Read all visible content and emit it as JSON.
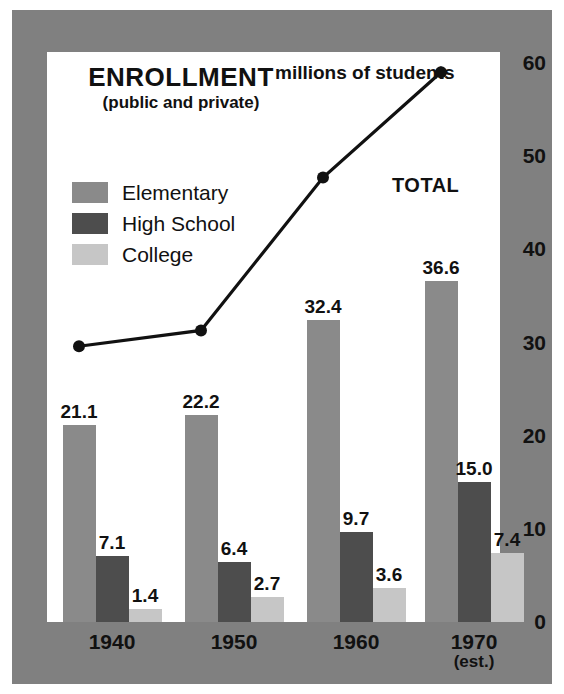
{
  "chart_data": {
    "type": "bar",
    "title": "ENROLLMENT",
    "subtitle": "(public and private)",
    "units_note": "millions of students",
    "total_annotation": "TOTAL",
    "xlabel": "",
    "ylabel": "",
    "ylim": [
      0,
      60
    ],
    "yticks": [
      0,
      10,
      20,
      30,
      40,
      50,
      60
    ],
    "ytick_labels": [
      "0",
      "10",
      "20",
      "30",
      "40",
      "50",
      "60"
    ],
    "grid": false,
    "legend_position": "upper-left",
    "categories": [
      "1940",
      "1950",
      "1960",
      "1970"
    ],
    "category_sublabels": [
      "",
      "",
      "",
      "(est.)"
    ],
    "series": [
      {
        "name": "Elementary",
        "color": "#8a8a8a",
        "values": [
          21.1,
          22.2,
          32.4,
          36.6
        ],
        "labels": [
          "21.1",
          "22.2",
          "32.4",
          "36.6"
        ]
      },
      {
        "name": "High School",
        "color": "#4d4d4d",
        "values": [
          7.1,
          6.4,
          9.7,
          15.0
        ],
        "labels": [
          "7.1",
          "6.4",
          "9.7",
          "15.0"
        ]
      },
      {
        "name": "College",
        "color": "#c6c6c6",
        "values": [
          1.4,
          2.7,
          3.6,
          7.4
        ],
        "labels": [
          "1.4",
          "2.7",
          "3.6",
          "7.4"
        ]
      }
    ],
    "overlay_line": {
      "name": "TOTAL",
      "type": "line",
      "color": "#111111",
      "marker": "circle",
      "x": [
        "1940",
        "1950",
        "1960",
        "1970"
      ],
      "values": [
        29.6,
        31.3,
        47.7,
        59.0
      ]
    }
  },
  "colors": {
    "mat": "#808080",
    "panel": "#ffffff",
    "ink": "#111111",
    "elementary": "#8a8a8a",
    "high_school": "#4d4d4d",
    "college": "#c6c6c6"
  }
}
